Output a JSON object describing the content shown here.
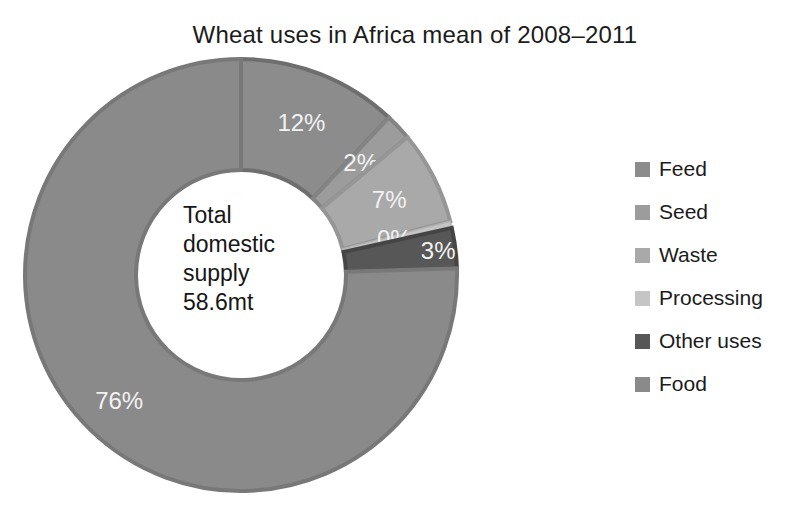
{
  "figure": {
    "title": "Wheat uses in Africa mean of 2008–2011"
  },
  "chart_data": {
    "type": "pie",
    "subtype": "donut",
    "title": "Wheat uses in Africa mean of 2008–2011",
    "categories": [
      "Feed",
      "Seed",
      "Waste",
      "Processing",
      "Other uses",
      "Food"
    ],
    "values": [
      12,
      2,
      7,
      0,
      3,
      76
    ],
    "value_unit": "%",
    "data_labels": [
      "12%",
      "2%",
      "7%",
      "0%",
      "3%",
      "76%"
    ],
    "slice_colors": [
      "#8c8c8c",
      "#9c9c9c",
      "#a9a9a9",
      "#c5c5c5",
      "#575757",
      "#8a8a8a"
    ],
    "slice_border_colors": [
      "#6e6e6e",
      "#848484",
      "#969696",
      "#b2b2b2",
      "#454545",
      "#787878"
    ],
    "data_label_color": "#f2f2f2",
    "start_angle_deg": 0,
    "direction": "clockwise",
    "donut_hole_fraction": 0.486,
    "min_slice_sweep_deg": 1.8,
    "label_radius_fractions": [
      0.76,
      0.76,
      0.77,
      0.73,
      0.92,
      0.81
    ],
    "legend_position": "right",
    "center_text_lines": [
      "Total",
      "domestic",
      "supply",
      "58.6mt"
    ]
  },
  "legend": {
    "items": [
      {
        "label": "Feed",
        "color": "#8c8c8c"
      },
      {
        "label": "Seed",
        "color": "#9c9c9c"
      },
      {
        "label": "Waste",
        "color": "#a9a9a9"
      },
      {
        "label": "Processing",
        "color": "#c5c5c5"
      },
      {
        "label": "Other uses",
        "color": "#575757"
      },
      {
        "label": "Food",
        "color": "#8a8a8a"
      }
    ]
  }
}
